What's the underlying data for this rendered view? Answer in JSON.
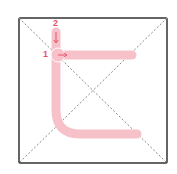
{
  "diagram": {
    "type": "stroke-order",
    "stroke_color": "#f7c1c9",
    "label_color": "#e8536b",
    "frame_color": "#333333",
    "guide_color": "#888888",
    "strokes": [
      {
        "number": "1",
        "direction": "right"
      },
      {
        "number": "2",
        "direction": "down"
      }
    ]
  }
}
